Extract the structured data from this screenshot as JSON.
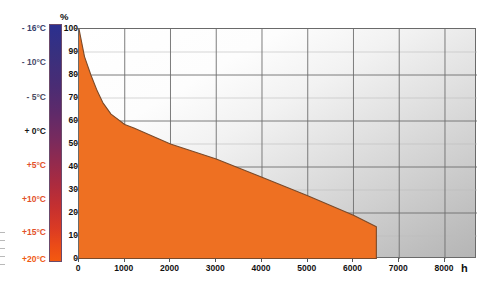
{
  "chart_data": {
    "type": "area",
    "title": "",
    "subtitle": "",
    "xlabel": "h",
    "ylabel": "%",
    "xlim": [
      0,
      8700
    ],
    "ylim": [
      0,
      100
    ],
    "grid": true,
    "legend_position": "none",
    "series": [
      {
        "name": "Cumulative operating-hours share",
        "color": "#ee7022",
        "x": [
          0,
          120,
          260,
          400,
          520,
          700,
          1000,
          1200,
          2000,
          3000,
          4000,
          5000,
          6000,
          6500,
          6500
        ],
        "values": [
          100,
          88,
          80,
          73,
          68,
          63,
          58.5,
          57,
          50,
          43.5,
          35.5,
          27.5,
          19,
          14,
          0
        ]
      }
    ],
    "x_ticks": [
      0,
      1000,
      2000,
      3000,
      4000,
      5000,
      6000,
      7000,
      8000
    ],
    "y_ticks": [
      0,
      10,
      20,
      30,
      40,
      50,
      60,
      70,
      80,
      90,
      100
    ],
    "annotations": []
  },
  "axes": {
    "y_unit": "%",
    "x_unit": "h",
    "y_tick_labels": [
      "100",
      "90",
      "80",
      "70",
      "60",
      "50",
      "40",
      "30",
      "20",
      "10",
      "0"
    ],
    "x_tick_labels": [
      "0",
      "1000",
      "2000",
      "3000",
      "4000",
      "5000",
      "6000",
      "7000",
      "8000"
    ]
  },
  "temperature_scale": {
    "name": "temperature-color-scale",
    "gradient_top_color": "#2b2f8f",
    "gradient_bottom_color": "#f4590f",
    "labels": [
      {
        "text": "- 16°C",
        "color": "#3a3f6b",
        "top": 24
      },
      {
        "text": "- 10°C",
        "color": "#4a4a6a",
        "top": 58
      },
      {
        "text": "- 5°C",
        "color": "#4a4a5e",
        "top": 93
      },
      {
        "text": "+ 0°C",
        "color": "#151515",
        "top": 127
      },
      {
        "text": "+5°C",
        "color": "#e2512a",
        "top": 161
      },
      {
        "text": "+10°C",
        "color": "#e2512a",
        "top": 195
      },
      {
        "text": "+15°C",
        "color": "#e2512a",
        "top": 228
      },
      {
        "text": "+20°C",
        "color": "#ef5a13",
        "top": 255
      }
    ]
  },
  "colors": {
    "area_fill": "#ee7022",
    "area_stroke": "#7a4a2a",
    "grid_major": "#6e6e6e",
    "grid_minor": "#bcbcbc",
    "frame": "#6a6a6a"
  }
}
